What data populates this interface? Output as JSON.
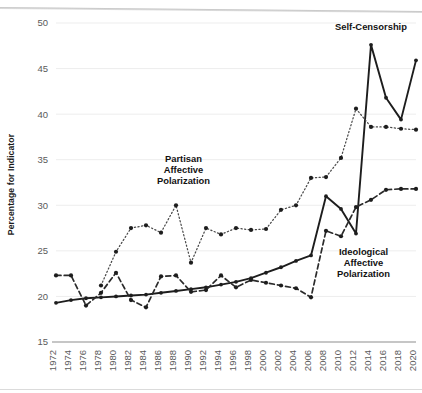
{
  "chart_data": {
    "type": "line",
    "title": "",
    "xlabel": "",
    "ylabel": "Percentage for Indicator",
    "ylim": [
      15,
      50
    ],
    "yticks": [
      15,
      20,
      25,
      30,
      35,
      40,
      45,
      50
    ],
    "grid": true,
    "legend_position": "inline-annotations",
    "x": [
      1972,
      1974,
      1976,
      1978,
      1980,
      1982,
      1984,
      1986,
      1988,
      1990,
      1992,
      1994,
      1996,
      1998,
      2000,
      2002,
      2004,
      2006,
      2008,
      2010,
      2012,
      2014,
      2016,
      2018,
      2020
    ],
    "categories": [
      "1972",
      "1974",
      "1976",
      "1978",
      "1980",
      "1982",
      "1984",
      "1986",
      "1988",
      "1990",
      "1992",
      "1994",
      "1996",
      "1998",
      "2000",
      "2002",
      "2004",
      "2006",
      "2008",
      "2010",
      "2012",
      "2014",
      "2016",
      "2018",
      "2020"
    ],
    "series": [
      {
        "name": "Self-Censorship",
        "style": "solid",
        "color": "#1d1d1d",
        "label_x": 2014,
        "label_y": 49.2,
        "x": [
          1972,
          1974,
          1976,
          1978,
          1980,
          1982,
          1984,
          1986,
          1988,
          1990,
          1992,
          1994,
          1996,
          1998,
          2000,
          2002,
          2004,
          2006,
          2008,
          2010,
          2012,
          2014,
          2016,
          2018,
          2020
        ],
        "values": [
          19.3,
          19.6,
          19.8,
          19.9,
          20.0,
          20.1,
          20.2,
          20.4,
          20.6,
          20.8,
          21.0,
          21.3,
          21.6,
          22.0,
          22.6,
          23.2,
          23.9,
          24.5,
          31.0,
          29.6,
          26.9,
          47.6,
          41.8,
          39.4,
          45.9
        ]
      },
      {
        "name": "Partisan Affective Polarization",
        "style": "dotted",
        "color": "#4a4a4a",
        "label_x": 1989,
        "label_y": 34.8,
        "x": [
          1978,
          1980,
          1982,
          1984,
          1986,
          1988,
          1990,
          1992,
          1994,
          1996,
          1998,
          2000,
          2002,
          2004,
          2006,
          2008,
          2010,
          2012,
          2014,
          2016,
          2018,
          2020
        ],
        "values": [
          21.2,
          24.9,
          27.5,
          27.8,
          27.0,
          30.0,
          23.7,
          27.5,
          26.8,
          27.5,
          27.3,
          27.4,
          29.5,
          30.0,
          33.0,
          33.1,
          35.2,
          40.6,
          38.6,
          38.6,
          38.4,
          38.3
        ]
      },
      {
        "name": "Ideological Affective Polarization",
        "style": "dashed",
        "color": "#2b2b2b",
        "label_x": 2013,
        "label_y": 24.6,
        "x": [
          1972,
          1974,
          1976,
          1978,
          1980,
          1982,
          1984,
          1986,
          1988,
          1990,
          1992,
          1994,
          1996,
          1998,
          2000,
          2002,
          2004,
          2006,
          2008,
          2010,
          2012,
          2014,
          2016,
          2018,
          2020
        ],
        "values": [
          22.3,
          22.3,
          19.0,
          20.4,
          22.6,
          19.6,
          18.8,
          22.2,
          22.3,
          20.5,
          20.7,
          22.3,
          21.0,
          21.8,
          21.5,
          21.2,
          20.9,
          19.9,
          27.2,
          26.6,
          29.8,
          30.6,
          31.7,
          31.8,
          31.8
        ]
      }
    ],
    "annotations": [
      {
        "text": "Self-Censorship",
        "lines": [
          "Self-Censorship"
        ]
      },
      {
        "text": "Partisan Affective Polarization",
        "lines": [
          "Partisan",
          "Affective",
          "Polarization"
        ]
      },
      {
        "text": "Ideological Affective Polarization",
        "lines": [
          "Ideological",
          "Affective",
          "Polarization"
        ]
      }
    ]
  }
}
